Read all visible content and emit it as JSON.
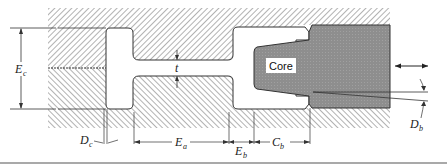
{
  "diagram": {
    "type": "mold cross-section with core",
    "labels": {
      "core": "Core",
      "Ec": {
        "main": "E",
        "sub": "c"
      },
      "t": {
        "main": "t"
      },
      "Dc": {
        "main": "D",
        "sub": "c"
      },
      "Ea": {
        "main": "E",
        "sub": "a"
      },
      "Eb": {
        "main": "E",
        "sub": "b"
      },
      "Cb": {
        "main": "C",
        "sub": "b"
      },
      "Db": {
        "main": "D",
        "sub": "b"
      }
    },
    "colors": {
      "hatch": "#555555",
      "core_fill": "#8c8c8c",
      "outline": "#333333",
      "background": "#ffffff"
    }
  }
}
